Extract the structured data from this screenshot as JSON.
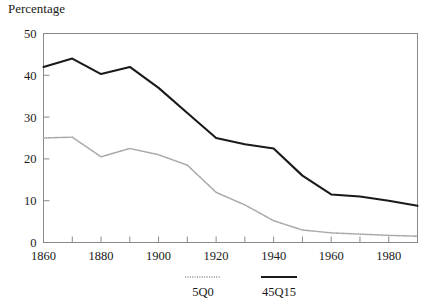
{
  "chart_data": {
    "type": "line",
    "title": "Percentage",
    "xlabel": "",
    "ylabel": "",
    "ylim": [
      0,
      50
    ],
    "xlim": [
      1860,
      1990
    ],
    "yticks": [
      0,
      10,
      20,
      30,
      40,
      50
    ],
    "xticks": [
      1860,
      1880,
      1900,
      1920,
      1940,
      1960,
      1980
    ],
    "x_minor_step": 10,
    "grid": false,
    "legend_position": "bottom",
    "x": [
      1860,
      1870,
      1880,
      1890,
      1900,
      1910,
      1920,
      1930,
      1940,
      1950,
      1960,
      1970,
      1980,
      1990
    ],
    "series": [
      {
        "name": "5Q0",
        "style": "dotted",
        "color": "#a8a8a8",
        "values": [
          25.0,
          25.2,
          20.5,
          22.5,
          21.0,
          18.5,
          12.0,
          9.0,
          5.2,
          3.0,
          2.3,
          2.0,
          1.7,
          1.5
        ]
      },
      {
        "name": "45Q15",
        "style": "solid",
        "color": "#1a1a1a",
        "values": [
          42.0,
          44.0,
          40.3,
          42.0,
          37.0,
          31.0,
          25.0,
          23.5,
          22.5,
          16.0,
          11.5,
          11.0,
          10.0,
          8.8
        ]
      }
    ]
  },
  "legend": {
    "items": [
      {
        "label": "5Q0"
      },
      {
        "label": "45Q15"
      }
    ]
  },
  "axes": {
    "y_tick_labels": [
      "0",
      "10",
      "20",
      "30",
      "40",
      "50"
    ],
    "x_tick_labels": [
      "1860",
      "1880",
      "1900",
      "1920",
      "1940",
      "1960",
      "1980"
    ]
  }
}
